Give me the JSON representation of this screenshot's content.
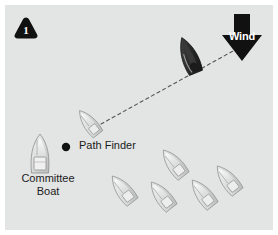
{
  "diagram": {
    "kind": "sailing-race-start-diagram",
    "step_badge": {
      "number": "1",
      "shape": "rounded-triangle",
      "fill": "#111111",
      "text_color": "#ffffff"
    },
    "background_color": "#e3e4e4",
    "page_color": "#ffffff",
    "wind": {
      "label": "Wind",
      "direction": "down",
      "fill": "#111111",
      "text_color": "#ffffff"
    },
    "labels": {
      "path_finder": "Path Finder",
      "committee_boat": "Committee Boat"
    },
    "marker": {
      "name": "start-mark-dot",
      "color": "#111111"
    },
    "course_line": {
      "style": "dashed",
      "color": "#4a4a4a"
    },
    "vessels": [
      {
        "name": "lead-sailboat",
        "tone": "dark",
        "fill": "#2a2a2a"
      },
      {
        "name": "path-finder-boat",
        "tone": "light",
        "fill": "#d0d1d1"
      },
      {
        "name": "committee-boat",
        "tone": "light",
        "fill": "#dcdddd"
      },
      {
        "name": "fleet-boat-1",
        "tone": "light",
        "fill": "#d4d5d5"
      },
      {
        "name": "fleet-boat-2",
        "tone": "light",
        "fill": "#d4d5d5"
      },
      {
        "name": "fleet-boat-3",
        "tone": "light",
        "fill": "#d4d5d5"
      },
      {
        "name": "fleet-boat-4",
        "tone": "light",
        "fill": "#d4d5d5"
      },
      {
        "name": "fleet-boat-5",
        "tone": "light",
        "fill": "#d4d5d5"
      }
    ]
  }
}
